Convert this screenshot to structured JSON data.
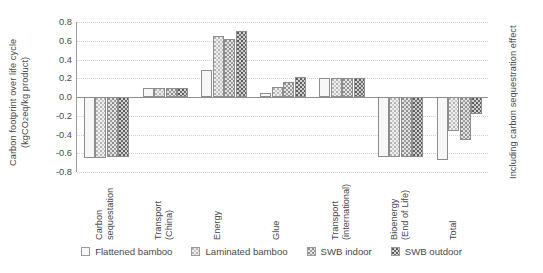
{
  "chart_data": {
    "type": "bar",
    "title": "",
    "xlabel": "",
    "ylabel": "Carbon footprint over life cycle\n(kgCO2eq/kg product)",
    "ylabel_right": "Including carbon sequestration effect",
    "ylim": [
      -0.8,
      0.8
    ],
    "yticks": [
      "0.8",
      "0.6",
      "0.4",
      "0.2",
      "0.0",
      "-0.2",
      "-0.4",
      "-0.6",
      "-0.8"
    ],
    "ytick_values": [
      0.8,
      0.6,
      0.4,
      0.2,
      0.0,
      -0.2,
      -0.4,
      -0.6,
      -0.8
    ],
    "grid": true,
    "legend_position": "bottom",
    "categories": [
      "Carbon\nsequestation",
      "Transport\n(China)",
      "Energy",
      "Glue",
      "Transport\n(international)",
      "Bioenergy\n(End of Life)",
      "Total"
    ],
    "series": [
      {
        "name": "Flattened bamboo",
        "pattern": "p0",
        "values": [
          -0.65,
          0.1,
          0.29,
          0.04,
          0.2,
          -0.64,
          -0.67
        ]
      },
      {
        "name": "Laminated bamboo",
        "pattern": "p1",
        "values": [
          -0.65,
          0.1,
          0.65,
          0.11,
          0.2,
          -0.64,
          -0.36
        ]
      },
      {
        "name": "SWB indoor",
        "pattern": "p2",
        "values": [
          -0.64,
          0.1,
          0.62,
          0.16,
          0.2,
          -0.64,
          -0.46
        ]
      },
      {
        "name": "SWB outdoor",
        "pattern": "p3",
        "values": [
          -0.64,
          0.1,
          0.7,
          0.21,
          0.2,
          -0.64,
          -0.18
        ]
      }
    ]
  },
  "legend": {
    "items": [
      {
        "label": "Flattened bamboo"
      },
      {
        "label": "Laminated bamboo"
      },
      {
        "label": "SWB indoor"
      },
      {
        "label": "SWB outdoor"
      }
    ]
  }
}
